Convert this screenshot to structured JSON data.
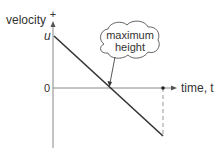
{
  "diagram": {
    "type": "velocity-time graph",
    "y_axis": {
      "label": "velocity",
      "positive_marker": "+",
      "intercept_label": "u",
      "origin_label": "0"
    },
    "x_axis": {
      "label": "time, t"
    },
    "callout": {
      "line1": "maximum",
      "line2": "height"
    },
    "colors": {
      "axis": "#777777",
      "line": "#333333",
      "dashed": "#999999",
      "text": "#333333"
    }
  }
}
